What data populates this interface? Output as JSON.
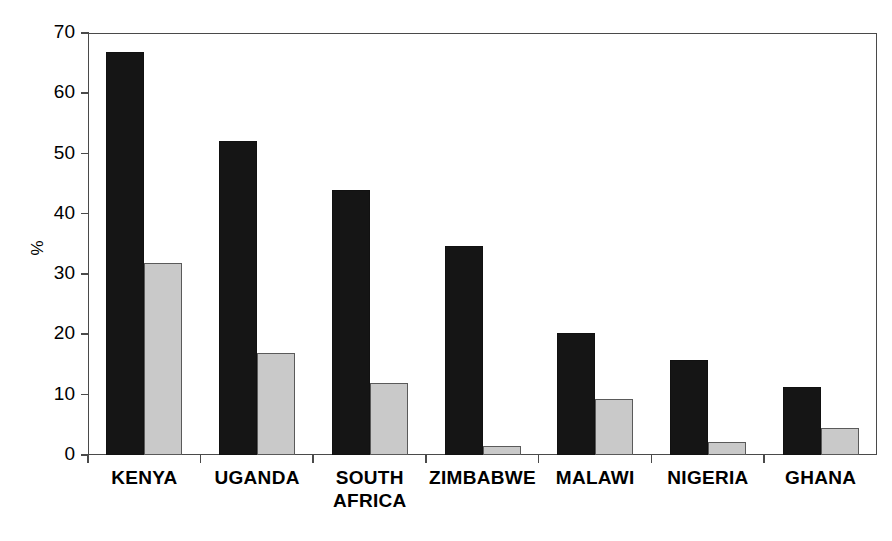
{
  "chart_data": {
    "type": "bar",
    "title": "",
    "xlabel": "",
    "ylabel": "%",
    "ylim": [
      0,
      70
    ],
    "yticks": [
      0,
      10,
      20,
      30,
      40,
      50,
      60,
      70
    ],
    "ytick_labels": [
      "0",
      "10",
      "20",
      "30",
      "40",
      "50",
      "60",
      "70"
    ],
    "grid": false,
    "legend": "none",
    "categories": [
      "KENYA",
      "UGANDA",
      "SOUTH\nAFRICA",
      "ZIMBABWE",
      "MALAWI",
      "NIGERIA",
      "GHANA"
    ],
    "series": [
      {
        "name": "series-1",
        "color": "#151515",
        "values": [
          66.8,
          52.1,
          43.9,
          34.7,
          20.3,
          15.8,
          11.2
        ]
      },
      {
        "name": "series-2",
        "color": "#c9c9c9",
        "values": [
          31.9,
          17.0,
          11.9,
          1.5,
          9.3,
          2.1,
          4.5
        ]
      }
    ]
  }
}
